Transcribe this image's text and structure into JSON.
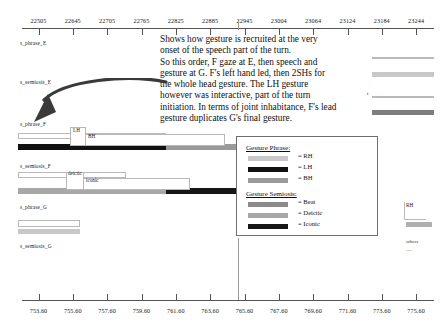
{
  "top_axis": {
    "labels": [
      "22505",
      "22645",
      "22705",
      "22765",
      "22825",
      "22885",
      "22945",
      "23004",
      "23064",
      "23124",
      "23184",
      "23244"
    ]
  },
  "bottom_axis": {
    "labels": [
      "753.60",
      "755.60",
      "757.60",
      "759.60",
      "761.60",
      "763.60",
      "765.60",
      "767.60",
      "769.60",
      "771.60",
      "773.60",
      "775.60"
    ]
  },
  "rows": [
    {
      "label": "s_phrase_E"
    },
    {
      "label": "s_semiosis_E"
    },
    {
      "label": "s_phrase_F"
    },
    {
      "label": "s_semiosis_F"
    },
    {
      "label": "s_phrase_G"
    },
    {
      "label": "s_semiosis_G"
    }
  ],
  "narrative": {
    "text": "Shows how gesture is recruited at the very\nonset of the speech part of the turn.\nSo this order, F gaze at E, then speech and\ngesture at G. F's left hand led, then 2SHs for\nthe whole head gesture. The LH gesture\nhowever was interactive, part of the turn\ninitiation. In terms of joint inhabitance, F's lead\ngesture duplicates G's final gesture."
  },
  "legend": {
    "phrase_title": "Gesture Phrase:",
    "phrase_items": [
      {
        "label": "= RH",
        "color": "#c8c8c8"
      },
      {
        "label": "= LH",
        "color": "#111111"
      },
      {
        "label": "= BH",
        "color": "#9a9a9a"
      }
    ],
    "semiosis_title": "Gesture Semiosis:",
    "semiosis_items": [
      {
        "label": "= Beat",
        "color": "#8a8a8a"
      },
      {
        "label": "= Deictic",
        "color": "#a8a8a8"
      },
      {
        "label": "= Iconic",
        "color": "#161616"
      }
    ]
  },
  "callouts": [
    {
      "name": "lh",
      "label": "LH"
    },
    {
      "name": "bh",
      "label": "BH"
    },
    {
      "name": "deictic",
      "label": "deictic"
    },
    {
      "name": "iconic",
      "label": "iconic"
    },
    {
      "name": "rh",
      "label": "RH"
    }
  ],
  "tags": [
    {
      "name": "t-tag",
      "label": "t"
    },
    {
      "name": "others-tag",
      "label": "others"
    },
    {
      "name": "others-dots",
      "label": "....."
    }
  ],
  "colors": {
    "light_gray": "#c8c8c8",
    "mid_gray": "#9a9a9a",
    "dark_gray": "#7d7d7d",
    "black": "#111111",
    "axis": "#555555",
    "outline": "#b9b9b9"
  }
}
